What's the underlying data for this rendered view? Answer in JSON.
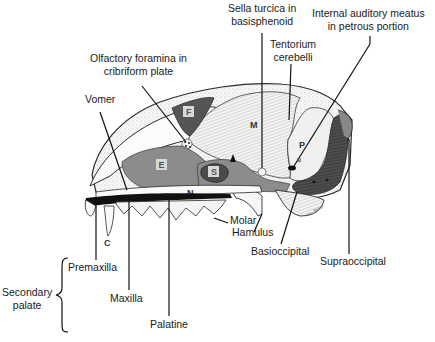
{
  "figure": {
    "type": "lateral sagittal section of skull",
    "colors": {
      "background": "#ffffff",
      "bone_outline": "#2a2a2a",
      "bone_fill": "#f4f4f4",
      "ethmoid_region": "#8c8c8c",
      "frontal_sinus": "#555555",
      "sphenoid_sinus": "#4a4a4a",
      "occipital_region": "#555555",
      "palate_black": "#111111",
      "box_fill": "#d9d9d9"
    },
    "region_letters": {
      "F": "F",
      "E": "E",
      "S": "S",
      "M": "M",
      "P": "P",
      "N": "N",
      "C": "C",
      "B": "B"
    },
    "signature": "J.L. Beery"
  },
  "labels": {
    "olfactory": [
      "Olfactory foramina in",
      "cribriform plate"
    ],
    "vomer": "Vomer",
    "sella": [
      "Sella turcica in",
      "basisphenoid"
    ],
    "tentorium": [
      "Tentorium",
      "cerebelli"
    ],
    "auditory": [
      "Internal auditory meatus",
      "in petrous portion"
    ],
    "molar": "Molar",
    "hamulus": "Hamulus",
    "basioccipital": "Basioccipital",
    "supraoccipital": "Supraoccipital",
    "premaxilla": "Premaxilla",
    "maxilla": "Maxilla",
    "palatine": "Palatine",
    "secondary_palate": [
      "Secondary",
      "palate"
    ]
  }
}
